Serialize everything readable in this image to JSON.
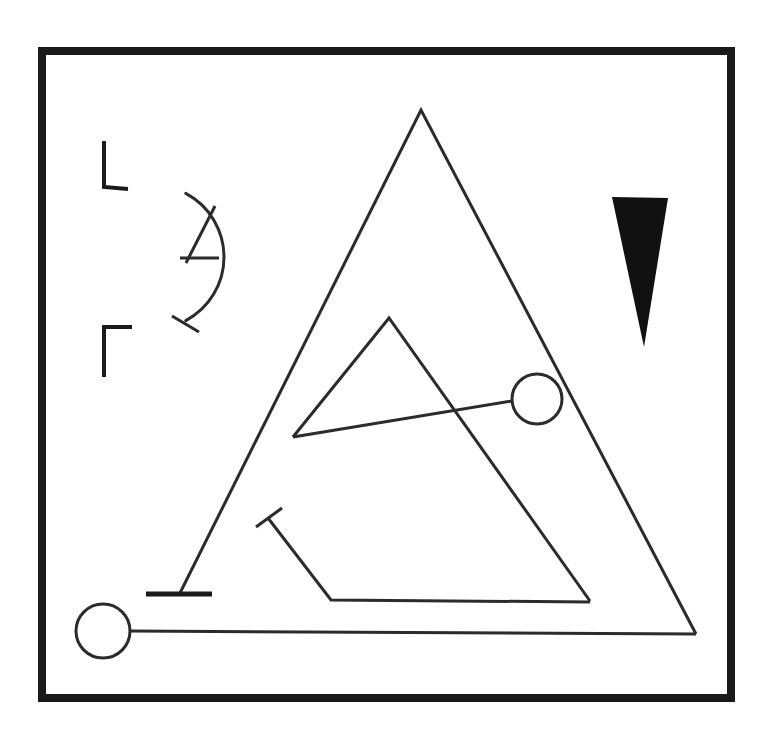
{
  "canvas": {
    "width": 780,
    "height": 751,
    "background": "#ffffff",
    "title": "Abstract geometric line drawing"
  },
  "palette": {
    "ink": "#1a1a1a",
    "stroke": "#2b2b2b",
    "fill_solid": "#111111",
    "paper": "#ffffff"
  },
  "frame": {
    "label": "outer-border-frame",
    "x": 38,
    "y": 47,
    "width": 697,
    "height": 655,
    "thickness": 8,
    "color": "#1a1a1a"
  },
  "shapes": {
    "sun_arc": {
      "label": "sun-arc-open-left",
      "center_x": 152,
      "center_y": 257,
      "radius": 72,
      "start_angle_deg": -62,
      "end_angle_deg": 62,
      "stroke_width": 3
    },
    "sun_rays": [
      {
        "label": "ray-upper-vertical",
        "points": "104,141 104,187 128,189",
        "stroke_width": 4
      },
      {
        "label": "ray-upper-diagonal",
        "points": "186,263 215,206",
        "stroke_width": 3
      },
      {
        "label": "ray-middle-horizontal",
        "points": "180,258 219,258",
        "stroke_width": 3
      },
      {
        "label": "ray-lower-diagonal",
        "points": "172,316 199,332",
        "stroke_width": 3
      },
      {
        "label": "ray-lower-vertical",
        "points": "132,327 104,327 104,377",
        "stroke_width": 4
      }
    ],
    "black_wedge": {
      "label": "solid-black-wedge",
      "points": "612,197 668,198 644,347",
      "fill": "#111111"
    },
    "big_triangle": {
      "label": "large-outline-triangle",
      "apex": [
        421,
        110
      ],
      "left_foot": [
        180,
        593
      ],
      "right_foot": [
        696,
        634
      ],
      "stroke_width": 3,
      "closed": false
    },
    "big_triangle_base_line": {
      "label": "long-baseline",
      "points": "130,631 696,634",
      "stroke_width": 3
    },
    "left_foot_bar": {
      "label": "left-leg-foot-bar",
      "points": "146,594 212,594",
      "stroke_width": 5
    },
    "inner_triangle": {
      "label": "inner-outline-triangle",
      "apex": [
        389,
        318
      ],
      "left_corner": [
        293,
        437
      ],
      "bottom_right": [
        590,
        601
      ],
      "stroke_width": 3
    },
    "chord_line": {
      "label": "chord-to-circle",
      "points": "293,437 512,401",
      "stroke_width": 3
    },
    "circle_right": {
      "label": "right-circle-node",
      "cx": 537,
      "cy": 399,
      "r": 25,
      "stroke_width": 3
    },
    "circle_bottom_left": {
      "label": "bottom-left-circle-node",
      "cx": 103,
      "cy": 631,
      "r": 27,
      "stroke_width": 3
    },
    "hook_path": {
      "label": "hook-polyline",
      "points": "268,518 331,600 590,602",
      "stroke_width": 3
    },
    "hook_tick": {
      "label": "hook-tick-crossbar",
      "points": "256,527 282,508",
      "stroke_width": 3
    }
  },
  "meta": {
    "shape_count_label": "14",
    "figure_kind": "line-art"
  }
}
